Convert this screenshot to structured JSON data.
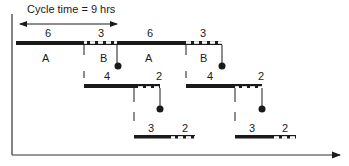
{
  "diagram": {
    "title": "Cycle time = 9 hrs",
    "colors": {
      "ink": "#1a1a1a",
      "hatch_fill": "#ffffff"
    },
    "row1": {
      "top_labels": [
        "6",
        "3",
        "6",
        "3"
      ],
      "bottom_labels": [
        "A",
        "B",
        "A",
        "B"
      ]
    },
    "row2": {
      "labels": [
        "4",
        "2",
        "4",
        "2"
      ]
    },
    "row3": {
      "labels": [
        "3",
        "2",
        "3",
        "2"
      ]
    },
    "axes": {
      "x_arrow": true,
      "y_axis": true
    }
  }
}
